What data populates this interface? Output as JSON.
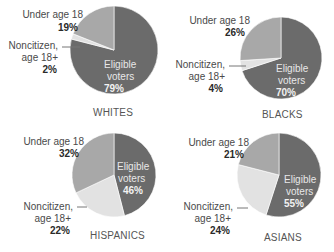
{
  "colors": {
    "eligible": "#6b6b6b",
    "under18": "#a8a8a8",
    "noncitizen": "#e2e2e2",
    "leader": "#777777"
  },
  "labels": {
    "under18_line1": "Under age 18",
    "noncitizen_line1": "Noncitizen,",
    "noncitizen_line2": "age 18+",
    "eligible_line1": "Eligible",
    "eligible_line2": "voters"
  },
  "chart_data": [
    {
      "type": "pie",
      "title": "WHITES",
      "categories": [
        "Eligible voters",
        "Noncitizen, age 18+",
        "Under age 18"
      ],
      "values": [
        79,
        2,
        19
      ],
      "value_labels": [
        "79%",
        "2%",
        "19%"
      ]
    },
    {
      "type": "pie",
      "title": "BLACKS",
      "categories": [
        "Eligible voters",
        "Noncitizen, age 18+",
        "Under age 18"
      ],
      "values": [
        70,
        4,
        26
      ],
      "value_labels": [
        "70%",
        "4%",
        "26%"
      ]
    },
    {
      "type": "pie",
      "title": "HISPANICS",
      "categories": [
        "Eligible voters",
        "Noncitizen, age 18+",
        "Under age 18"
      ],
      "values": [
        46,
        22,
        32
      ],
      "value_labels": [
        "46%",
        "22%",
        "32%"
      ]
    },
    {
      "type": "pie",
      "title": "ASIANS",
      "categories": [
        "Eligible voters",
        "Noncitizen, age 18+",
        "Under age 18"
      ],
      "values": [
        55,
        24,
        21
      ],
      "value_labels": [
        "55%",
        "24%",
        "21%"
      ]
    }
  ]
}
